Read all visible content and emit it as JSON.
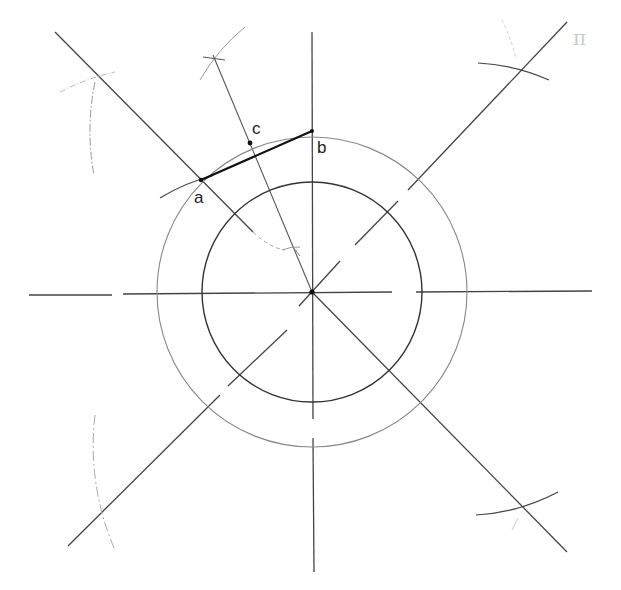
{
  "diagram": {
    "type": "geometric-construction",
    "center": {
      "x": 312,
      "y": 292
    },
    "circles": [
      {
        "name": "inner-circle",
        "r": 110,
        "color": "#333333"
      },
      {
        "name": "outer-circle",
        "r": 155,
        "color": "#777777"
      }
    ],
    "points": {
      "a": {
        "label": "a",
        "x": 201,
        "y": 180
      },
      "b": {
        "label": "b",
        "x": 312,
        "y": 131
      },
      "c": {
        "label": "c",
        "x": 250,
        "y": 143
      }
    },
    "segment_ab": {
      "from": "a",
      "to": "b",
      "color": "#111111"
    },
    "line_color": "#444444",
    "arc_color": "#999999",
    "corner_mark": "π"
  }
}
